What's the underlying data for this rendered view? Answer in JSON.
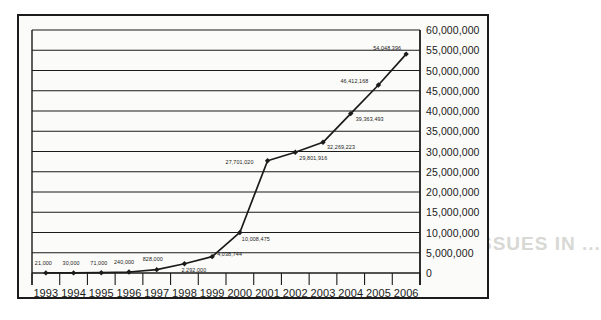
{
  "bleed_text": {
    "line1": "INTERNATIONAL ISSUES IN ...",
    "line2": "BROKEN ..."
  },
  "chart_data": {
    "type": "line",
    "title": "",
    "subtitle": "",
    "xlabel": "",
    "ylabel": "",
    "grid": true,
    "legend": "none",
    "xlim": [
      "1993",
      "2006"
    ],
    "ylim": [
      0,
      60000000
    ],
    "ytick_step": 5000000,
    "categories": [
      "1993",
      "1994",
      "1995",
      "1996",
      "1997",
      "1998",
      "1999",
      "2000",
      "2001",
      "2002",
      "2003",
      "2004",
      "2005",
      "2006"
    ],
    "values": [
      21000,
      30000,
      71000,
      240000,
      828000,
      2292000,
      4038744,
      10008475,
      27701020,
      29801916,
      32269223,
      39363493,
      46412168,
      54048396
    ],
    "point_labels": [
      "21,000",
      "30,000",
      "71,000",
      "240,000",
      "828,000",
      "2,292,000",
      "4,038,744",
      "10,008,475",
      "27,701,020",
      "29,801,916",
      "32,269,223",
      "39,363,493",
      "46,412,168",
      "54,048,396"
    ],
    "ytick_labels": [
      "0",
      "5,000,000",
      "10,000,000",
      "15,000,000",
      "20,000,000",
      "25,000,000",
      "30,000,000",
      "35,000,000",
      "40,000,000",
      "45,000,000",
      "50,000,000",
      "55,000,000",
      "60,000,000"
    ],
    "series": [
      {
        "name": "series-1",
        "color": "#1b1b1b",
        "marker": "diamond",
        "values": [
          21000,
          30000,
          71000,
          240000,
          828000,
          2292000,
          4038744,
          10008475,
          27701020,
          29801916,
          32269223,
          39363493,
          46412168,
          54048396
        ]
      }
    ]
  }
}
